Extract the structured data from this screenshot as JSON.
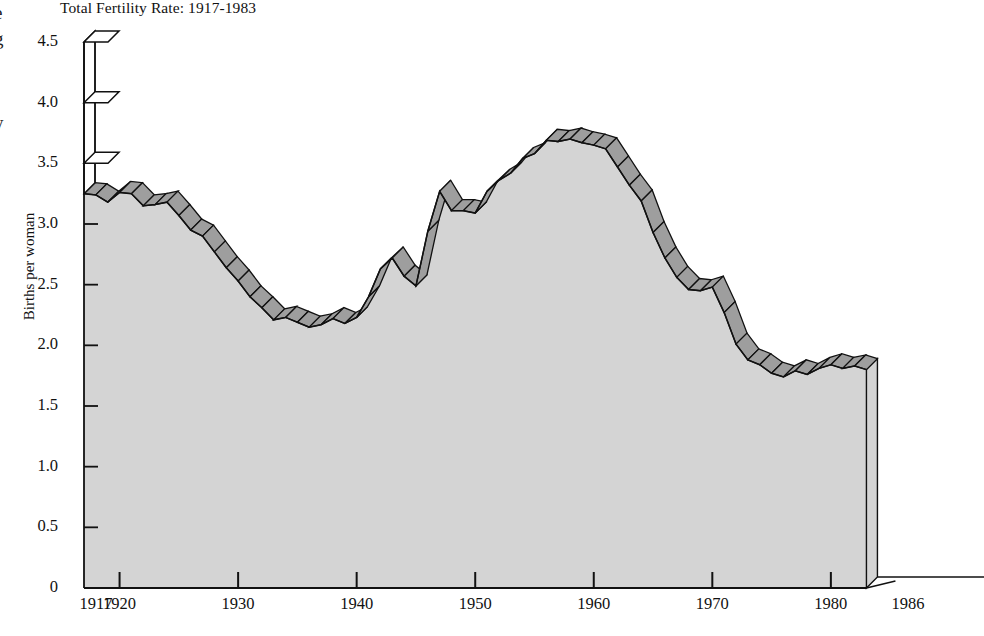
{
  "page": {
    "bleed_left": [
      {
        "name": "bleed-fragment-e",
        "text": "e"
      },
      {
        "name": "bleed-fragment-g",
        "text": "g"
      },
      {
        "name": "bleed-fragment-y",
        "text": "y"
      }
    ]
  },
  "chart_data": {
    "type": "area",
    "title": "Total Fertility Rate: 1917-1983",
    "xlabel": "",
    "ylabel": "Births per woman",
    "xlim": [
      1917,
      1986
    ],
    "ylim": [
      0,
      4.5
    ],
    "grid": false,
    "legend": "none",
    "style": "3d-ribbon-area",
    "colors": {
      "fill": "#d4d4d4",
      "ribbon": "#9e9e9e",
      "line": "#111111",
      "axis": "#000000",
      "background": "#ffffff"
    },
    "xticks": [
      1917,
      1920,
      1930,
      1940,
      1950,
      1960,
      1970,
      1980,
      1986
    ],
    "xticklabels": [
      "1917",
      "1920",
      "1930",
      "1940",
      "1950",
      "1960",
      "1970",
      "1980",
      "1986"
    ],
    "yticks": [
      0,
      0.5,
      1.0,
      1.5,
      2.0,
      2.5,
      3.0,
      3.5,
      4.0,
      4.5
    ],
    "yticklabels": [
      "0",
      "0.5",
      "1.0",
      "1.5",
      "2.0",
      "2.5",
      "3.0",
      "3.5",
      "4.0",
      "4.5"
    ],
    "x": [
      1917,
      1918,
      1919,
      1920,
      1921,
      1922,
      1923,
      1924,
      1925,
      1926,
      1927,
      1928,
      1929,
      1930,
      1931,
      1932,
      1933,
      1934,
      1935,
      1936,
      1937,
      1938,
      1939,
      1940,
      1941,
      1942,
      1943,
      1944,
      1945,
      1946,
      1947,
      1948,
      1949,
      1950,
      1951,
      1952,
      1953,
      1954,
      1955,
      1956,
      1957,
      1958,
      1959,
      1960,
      1961,
      1962,
      1963,
      1964,
      1965,
      1966,
      1967,
      1968,
      1969,
      1970,
      1971,
      1972,
      1973,
      1974,
      1975,
      1976,
      1977,
      1978,
      1979,
      1980,
      1981,
      1982,
      1983
    ],
    "values": [
      3.25,
      3.24,
      3.18,
      3.26,
      3.25,
      3.15,
      3.16,
      3.18,
      3.07,
      2.95,
      2.9,
      2.77,
      2.64,
      2.53,
      2.4,
      2.31,
      2.21,
      2.23,
      2.19,
      2.15,
      2.17,
      2.22,
      2.18,
      2.23,
      2.4,
      2.63,
      2.72,
      2.57,
      2.49,
      2.94,
      3.27,
      3.11,
      3.11,
      3.09,
      3.27,
      3.36,
      3.42,
      3.54,
      3.58,
      3.69,
      3.68,
      3.7,
      3.67,
      3.65,
      3.62,
      3.47,
      3.32,
      3.19,
      2.93,
      2.72,
      2.56,
      2.46,
      2.45,
      2.48,
      2.27,
      2.01,
      1.88,
      1.84,
      1.77,
      1.74,
      1.79,
      1.76,
      1.81,
      1.84,
      1.81,
      1.83,
      1.8
    ]
  }
}
